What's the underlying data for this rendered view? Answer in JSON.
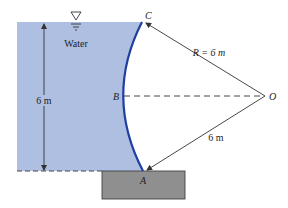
{
  "diagram": {
    "fluid_label": "Water",
    "depth_label": "6 m",
    "radius_label": "R = 6 m",
    "radius_label_lower": "6 m",
    "points": {
      "A": "A",
      "B": "B",
      "C": "C",
      "O": "O"
    },
    "colors": {
      "water": "#aebfe2",
      "gate": "#1f3fa0",
      "block": "#8f8f8f",
      "lines": "#333333"
    }
  }
}
